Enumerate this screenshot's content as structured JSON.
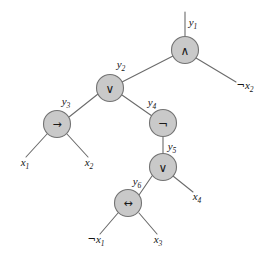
{
  "diagram": {
    "type": "tree",
    "background_color": "#ffffff",
    "node_fill_color": "#c9c9c9",
    "node_stroke_color": "#737373",
    "edge_color": "#6b6b6b",
    "text_color": "#141414",
    "root_wire_label": "y",
    "root_wire_sub": "1"
  },
  "nodes": [
    {
      "id": "y1",
      "label": "y",
      "sub": "1",
      "operator": "∧",
      "operator_name": "and-gate",
      "cx": 185,
      "cy": 50,
      "r": 13.5,
      "label_x": 193,
      "label_y": 26
    },
    {
      "id": "y2",
      "label": "y",
      "sub": "2",
      "operator": "∨",
      "operator_name": "or-gate",
      "cx": 110,
      "cy": 88,
      "r": 13.5,
      "label_x": 121,
      "label_y": 68
    },
    {
      "id": "y3",
      "label": "y",
      "sub": "3",
      "operator": "→",
      "operator_name": "implication-gate",
      "cx": 57,
      "cy": 124,
      "r": 13.5,
      "label_x": 66,
      "label_y": 105
    },
    {
      "id": "y4",
      "label": "y",
      "sub": "4",
      "operator": "¬",
      "operator_name": "not-gate",
      "cx": 163,
      "cy": 123,
      "r": 13.5,
      "label_x": 152,
      "label_y": 106
    },
    {
      "id": "y5",
      "label": "y",
      "sub": "5",
      "operator": "∨",
      "operator_name": "or-gate",
      "cx": 163,
      "cy": 167,
      "r": 13.5,
      "label_x": 172,
      "label_y": 150
    },
    {
      "id": "y6",
      "label": "y",
      "sub": "6",
      "operator": "↔",
      "operator_name": "biconditional-gate",
      "cx": 128,
      "cy": 203,
      "r": 13.5,
      "label_x": 137,
      "label_y": 185
    }
  ],
  "leaves": [
    {
      "id": "leaf-x1",
      "negated": false,
      "label": "x",
      "sub": "1",
      "x": 25,
      "y": 166
    },
    {
      "id": "leaf-x2",
      "negated": false,
      "label": "x",
      "sub": "2",
      "x": 89,
      "y": 166
    },
    {
      "id": "leaf-not-x2",
      "negated": true,
      "label": "x",
      "sub": "2",
      "x": 245,
      "y": 89
    },
    {
      "id": "leaf-x4",
      "negated": false,
      "label": "x",
      "sub": "4",
      "x": 197,
      "y": 200
    },
    {
      "id": "leaf-not-x1",
      "negated": true,
      "label": "x",
      "sub": "1",
      "x": 96,
      "y": 243
    },
    {
      "id": "leaf-x3",
      "negated": false,
      "label": "x",
      "sub": "3",
      "x": 158,
      "y": 243
    }
  ],
  "edges": [
    {
      "id": "edge-root-wire",
      "name": "output-wire-y1",
      "x1": 185,
      "y1": 12,
      "x2": 185,
      "y2": 36
    },
    {
      "id": "edge-y1-y2",
      "name": "edge-y1-to-y2",
      "x1": 173,
      "y1": 56,
      "x2": 122,
      "y2": 82
    },
    {
      "id": "edge-y1-notx2",
      "name": "edge-y1-to-not-x2",
      "x1": 196,
      "y1": 58,
      "x2": 236,
      "y2": 82
    },
    {
      "id": "edge-y2-y3",
      "name": "edge-y2-to-y3",
      "x1": 98,
      "y1": 94,
      "x2": 69,
      "y2": 117
    },
    {
      "id": "edge-y2-y4",
      "name": "edge-y2-to-y4",
      "x1": 122,
      "y1": 95,
      "x2": 152,
      "y2": 116
    },
    {
      "id": "edge-y3-x1",
      "name": "edge-y3-to-x1",
      "x1": 47,
      "y1": 134,
      "x2": 26,
      "y2": 157
    },
    {
      "id": "edge-y3-x2",
      "name": "edge-y3-to-x2",
      "x1": 67,
      "y1": 134,
      "x2": 88,
      "y2": 157
    },
    {
      "id": "edge-y4-y5",
      "name": "edge-y4-to-y5",
      "x1": 163,
      "y1": 137,
      "x2": 163,
      "y2": 154
    },
    {
      "id": "edge-y5-y6",
      "name": "edge-y5-to-y6",
      "x1": 152,
      "y1": 176,
      "x2": 139,
      "y2": 195
    },
    {
      "id": "edge-y5-x4",
      "name": "edge-y5-to-x4",
      "x1": 173,
      "y1": 176,
      "x2": 193,
      "y2": 192
    },
    {
      "id": "edge-y6-notx1",
      "name": "edge-y6-to-not-x1",
      "x1": 118,
      "y1": 213,
      "x2": 100,
      "y2": 234
    },
    {
      "id": "edge-y6-x3",
      "name": "edge-y6-to-x3",
      "x1": 139,
      "y1": 213,
      "x2": 157,
      "y2": 234
    }
  ]
}
